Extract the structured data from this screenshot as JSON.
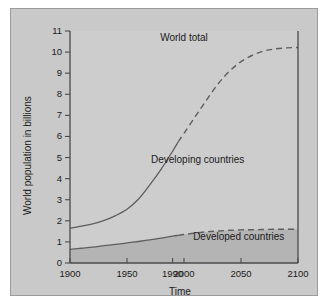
{
  "figure": {
    "panel_bg": "#c9c9c9",
    "page_bg": "#ffffff",
    "frame_color": "#4a4a4a",
    "line_color": "#5a5a5a",
    "fill_color": "#b3b3b3"
  },
  "chart_data": {
    "type": "line",
    "title": "",
    "xlabel": "Time",
    "ylabel": "World population in billions",
    "xlim": [
      1900,
      2100
    ],
    "ylim": [
      0,
      11
    ],
    "grid": false,
    "legend_position": "inline-annotations",
    "xticks": [
      1900,
      1950,
      1990,
      2000,
      2050,
      2100
    ],
    "xticklabels": [
      "1900",
      "1950",
      "1990",
      "2000",
      "2050",
      "2100"
    ],
    "yticks": [
      0,
      1,
      2,
      3,
      4,
      5,
      6,
      7,
      8,
      9,
      10,
      11
    ],
    "yticklabels": [
      "0",
      "1",
      "2",
      "3",
      "4",
      "5",
      "6",
      "7",
      "8",
      "9",
      "10",
      "11"
    ],
    "annotations": [
      {
        "text": "World total",
        "x": 2000,
        "y": 10.6
      },
      {
        "text": "Developing countries",
        "x": 2012,
        "y": 4.85
      },
      {
        "text": "Developed countries",
        "x": 2048,
        "y": 1.2
      }
    ],
    "solid_dashed_split_year": 1995,
    "series": [
      {
        "name": "World total",
        "style": "solid-then-dashed",
        "x": [
          1900,
          1910,
          1920,
          1930,
          1940,
          1950,
          1960,
          1970,
          1980,
          1990,
          1995,
          2000,
          2010,
          2020,
          2030,
          2040,
          2050,
          2060,
          2070,
          2080,
          2090,
          2100
        ],
        "values": [
          1.65,
          1.75,
          1.86,
          2.02,
          2.25,
          2.55,
          3.02,
          3.7,
          4.45,
          5.3,
          5.75,
          6.15,
          6.95,
          7.75,
          8.5,
          9.1,
          9.55,
          9.85,
          10.05,
          10.15,
          10.2,
          10.22
        ]
      },
      {
        "name": "Developed countries",
        "style": "solid-then-dashed",
        "x": [
          1900,
          1910,
          1920,
          1930,
          1940,
          1950,
          1960,
          1970,
          1980,
          1990,
          1995,
          2000,
          2010,
          2020,
          2030,
          2040,
          2050,
          2060,
          2070,
          2080,
          2090,
          2100
        ],
        "values": [
          0.65,
          0.7,
          0.75,
          0.82,
          0.88,
          0.95,
          1.02,
          1.1,
          1.18,
          1.27,
          1.31,
          1.35,
          1.42,
          1.48,
          1.52,
          1.55,
          1.57,
          1.58,
          1.59,
          1.6,
          1.6,
          1.6
        ]
      }
    ]
  }
}
